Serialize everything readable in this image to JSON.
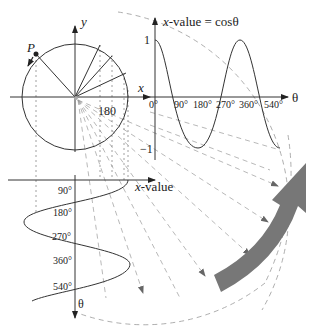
{
  "diagram": {
    "circle": {
      "axis_x_label": "x",
      "axis_y_label": "y",
      "point_label": "P",
      "angle_tick_label": "180"
    },
    "top_graph": {
      "y_axis_title_italic": "x",
      "y_axis_title_rest": "-value = cosθ",
      "x_axis_label": "θ",
      "y_ticks": [
        "1",
        "−1"
      ],
      "x_ticks": [
        "0°",
        "90°",
        "180°",
        "270°",
        "360°",
        "540°"
      ]
    },
    "bottom_graph": {
      "x_axis_title_italic": "x",
      "x_axis_title_rest": "-value",
      "theta_axis_label": "θ",
      "theta_ticks": [
        "90°",
        "180°",
        "270°",
        "360°",
        "540°"
      ]
    },
    "colors": {
      "line": "#333333",
      "dash": "#888888",
      "big_arrow": "#777777"
    }
  }
}
